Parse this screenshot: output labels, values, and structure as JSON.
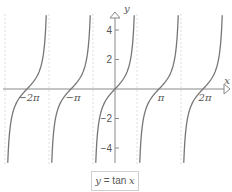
{
  "chart_data": {
    "type": "line",
    "title": "",
    "function": "y = tan x",
    "xlabel": "x",
    "ylabel": "y",
    "x_ticks": [
      {
        "value": -6.2832,
        "label": "-2π"
      },
      {
        "value": -3.1416,
        "label": "-π"
      },
      {
        "value": 3.1416,
        "label": "π"
      },
      {
        "value": 6.2832,
        "label": "2π"
      }
    ],
    "y_ticks": [
      {
        "value": 4,
        "label": "4"
      },
      {
        "value": 2,
        "label": "2"
      },
      {
        "value": -2,
        "label": "-2"
      },
      {
        "value": -4,
        "label": "-4"
      }
    ],
    "xlim": [
      -7.9,
      8.3
    ],
    "ylim": [
      -5.0,
      5.0
    ],
    "asymptotes": [
      -7.854,
      -4.712,
      -1.571,
      1.571,
      4.712
    ],
    "grid": "vertical dashed lines at asymptotes",
    "series": [
      {
        "name": "y = tan x",
        "color": "#777777",
        "branches_centered_at": [
          -6.2832,
          -3.1416,
          0,
          3.1416,
          6.2832
        ]
      }
    ],
    "legend": {
      "text": "y = tan x",
      "position": "bottom-center"
    }
  },
  "colors": {
    "axis": "#888888",
    "curve": "#777777",
    "grid": "#dddddd",
    "text": "#555555"
  },
  "legend": {
    "lhs": "y",
    "eq": " = tan ",
    "var": "x"
  }
}
